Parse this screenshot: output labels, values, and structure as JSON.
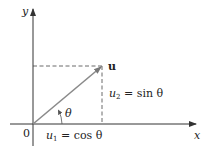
{
  "diagram": {
    "type": "vector-components",
    "axes": {
      "x_label": "x",
      "y_label": "y",
      "origin_label": "0"
    },
    "vector": {
      "label": "u"
    },
    "angle_label": "θ",
    "components": {
      "u1": {
        "var": "u",
        "sub": "1",
        "rhs": "= cos θ"
      },
      "u2": {
        "var": "u",
        "sub": "2",
        "rhs": "= sin θ"
      }
    },
    "colors": {
      "vector": "#8a8a8a",
      "axes": "#333333",
      "dashed": "#444444"
    }
  }
}
